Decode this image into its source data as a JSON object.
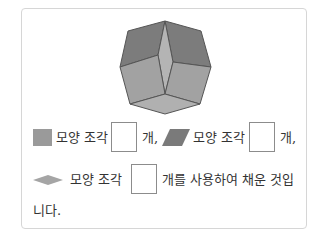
{
  "figure": {
    "name": "octagon made of square and rhombus tiles",
    "colors": {
      "dark": "#7c7c7c",
      "medium": "#a2a2a2",
      "light": "#b4b4b4",
      "edge": "#555555"
    }
  },
  "question": {
    "line1": {
      "square_label": "모양 조각",
      "unit1": "개,",
      "parallelogram_label": "모양 조각",
      "unit2": "개,"
    },
    "line2": {
      "rhombus_label": "모양 조각",
      "rest": "개를 사용하여 채운 것입"
    },
    "line3": {
      "text": "니다."
    },
    "answers": [
      "",
      "",
      ""
    ]
  }
}
